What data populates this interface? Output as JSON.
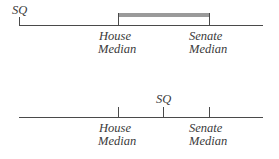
{
  "diagram": {
    "top_panel": {
      "status_quo_label": "SQ",
      "labels": [
        {
          "line1": "House",
          "line2": "Median"
        },
        {
          "line1": "Senate",
          "line2": "Median"
        }
      ],
      "shaded_interval": "House Median to Senate Median"
    },
    "bottom_panel": {
      "status_quo_label": "SQ",
      "labels": [
        {
          "line1": "House",
          "line2": "Median"
        },
        {
          "line1": "Senate",
          "line2": "Median"
        }
      ]
    },
    "colors": {
      "line": "#4a4a4a",
      "shaded_bar": "#9a9a9a",
      "text": "#3a3a3a"
    }
  }
}
